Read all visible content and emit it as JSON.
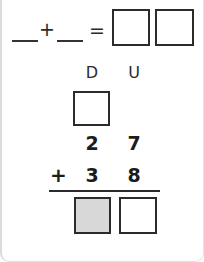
{
  "worksheet": {
    "equation_row": {
      "blank_addend_1": "",
      "plus_operator": "+",
      "blank_addend_2": "",
      "equals_operator": "=",
      "result_box_tens": "",
      "result_box_units": ""
    },
    "column_headings": {
      "tens": "D",
      "units": "U"
    },
    "carry_box": "",
    "addend_1": {
      "tens": "2",
      "units": "7"
    },
    "addend_2": {
      "operator": "+",
      "tens": "3",
      "units": "8"
    },
    "sum": {
      "tens_box": "",
      "units_box": ""
    },
    "colors": {
      "ink": "#2b2b2b",
      "digit": "#1c1c1c",
      "shaded_box_fill": "#d8d8d8",
      "empty_box_fill": "#ffffff",
      "card_background": "#ffffff",
      "card_border": "#dcdcdc"
    }
  }
}
